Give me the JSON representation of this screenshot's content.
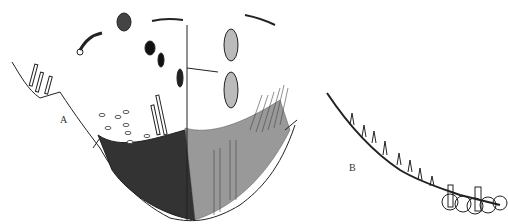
{
  "figure": {
    "panels": [
      {
        "id": "A",
        "label": "A",
        "description": "cross-section of cup-shaped structure with dark stippled base, hair-like projections and scattered cells"
      },
      {
        "id": "B",
        "label": "B",
        "description": "curved edge with bulbous projections and rounded cells"
      }
    ]
  },
  "colors": {
    "ink": "#222222",
    "background": "#ffffff"
  }
}
